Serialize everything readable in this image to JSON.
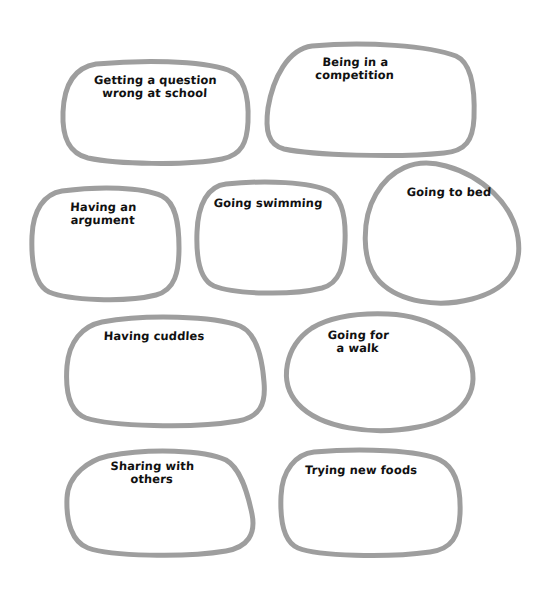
{
  "page": {
    "background_color": "#ffffff",
    "stroke_color": "#9e9e9e",
    "text_color": "#111111",
    "width": 541,
    "height": 593
  },
  "blobs": [
    {
      "id": "getting-a-question-wrong-at-school",
      "label": "Getting a question\nwrong at school",
      "shape": "rounded-rect",
      "box": {
        "x": 62,
        "y": 62,
        "w": 186,
        "h": 100
      },
      "label_box": {
        "x": 70,
        "y": 74,
        "w": 170
      }
    },
    {
      "id": "being-in-a-competition",
      "label": "Being in a\ncompetition",
      "shape": "trapezoid-blob",
      "box": {
        "x": 264,
        "y": 44,
        "w": 212,
        "h": 112
      },
      "label_box": {
        "x": 285,
        "y": 56,
        "w": 140
      }
    },
    {
      "id": "having-an-argument",
      "label": "Having an\nargument",
      "shape": "rounded-square",
      "box": {
        "x": 30,
        "y": 188,
        "w": 150,
        "h": 110
      },
      "label_box": {
        "x": 48,
        "y": 201,
        "w": 110
      }
    },
    {
      "id": "going-swimming",
      "label": "Going swimming",
      "shape": "rounded-square",
      "box": {
        "x": 196,
        "y": 182,
        "w": 150,
        "h": 110
      },
      "label_box": {
        "x": 200,
        "y": 197,
        "w": 136
      }
    },
    {
      "id": "going-to-bed",
      "label": "Going to bed",
      "shape": "egg",
      "box": {
        "x": 364,
        "y": 160,
        "w": 157,
        "h": 142
      },
      "label_box": {
        "x": 390,
        "y": 186,
        "w": 118
      }
    },
    {
      "id": "having-cuddles",
      "label": "Having cuddles",
      "shape": "slanted-blob",
      "box": {
        "x": 64,
        "y": 314,
        "w": 202,
        "h": 112
      },
      "label_box": {
        "x": 86,
        "y": 330,
        "w": 136
      }
    },
    {
      "id": "going-for-a-walk",
      "label": "Going for\na walk",
      "shape": "oval",
      "box": {
        "x": 284,
        "y": 312,
        "w": 190,
        "h": 118
      },
      "label_box": {
        "x": 308,
        "y": 329,
        "w": 100
      }
    },
    {
      "id": "sharing-with-others",
      "label": "Sharing with\nothers",
      "shape": "slanted-blob",
      "box": {
        "x": 64,
        "y": 448,
        "w": 192,
        "h": 108
      },
      "label_box": {
        "x": 92,
        "y": 460,
        "w": 120
      }
    },
    {
      "id": "trying-new-foods",
      "label": "Trying new foods",
      "shape": "rounded-rect",
      "box": {
        "x": 280,
        "y": 450,
        "w": 182,
        "h": 106
      },
      "label_box": {
        "x": 286,
        "y": 464,
        "w": 150
      }
    }
  ]
}
